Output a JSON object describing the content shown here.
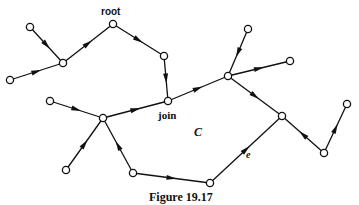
{
  "figure": {
    "caption": "Figure 19.17",
    "labels": {
      "root": "root",
      "join": "join",
      "cycle": "C",
      "edge": "e"
    }
  },
  "graph": {
    "nodes": [
      {
        "id": "a",
        "x": 30,
        "y": 27
      },
      {
        "id": "b",
        "x": 10,
        "y": 80
      },
      {
        "id": "n1",
        "x": 63,
        "y": 63
      },
      {
        "id": "root",
        "x": 113,
        "y": 24,
        "label": "root"
      },
      {
        "id": "n2",
        "x": 164,
        "y": 56
      },
      {
        "id": "join",
        "x": 168,
        "y": 101,
        "label": "join"
      },
      {
        "id": "n3",
        "x": 228,
        "y": 76
      },
      {
        "id": "t1",
        "x": 248,
        "y": 29
      },
      {
        "id": "t2",
        "x": 290,
        "y": 61
      },
      {
        "id": "n4",
        "x": 282,
        "y": 116
      },
      {
        "id": "n5",
        "x": 324,
        "y": 153
      },
      {
        "id": "t3",
        "x": 347,
        "y": 104
      },
      {
        "id": "n7",
        "x": 210,
        "y": 183
      },
      {
        "id": "n6",
        "x": 103,
        "y": 118
      },
      {
        "id": "l1",
        "x": 50,
        "y": 101
      },
      {
        "id": "l2",
        "x": 66,
        "y": 170
      },
      {
        "id": "n8",
        "x": 133,
        "y": 173
      }
    ],
    "edges": [
      {
        "from": "a",
        "to": "n1"
      },
      {
        "from": "b",
        "to": "n1"
      },
      {
        "from": "n1",
        "to": "root"
      },
      {
        "from": "root",
        "to": "n2"
      },
      {
        "from": "n2",
        "to": "join"
      },
      {
        "from": "join",
        "to": "n3"
      },
      {
        "from": "t1",
        "to": "n3"
      },
      {
        "from": "n3",
        "to": "t2"
      },
      {
        "from": "n3",
        "to": "n4"
      },
      {
        "from": "n5",
        "to": "n4"
      },
      {
        "from": "n5",
        "to": "t3"
      },
      {
        "from": "n7",
        "to": "n4",
        "label": "e"
      },
      {
        "from": "n8",
        "to": "n7"
      },
      {
        "from": "n8",
        "to": "n6"
      },
      {
        "from": "l1",
        "to": "n6"
      },
      {
        "from": "l2",
        "to": "n6"
      },
      {
        "from": "n6",
        "to": "join"
      }
    ]
  }
}
